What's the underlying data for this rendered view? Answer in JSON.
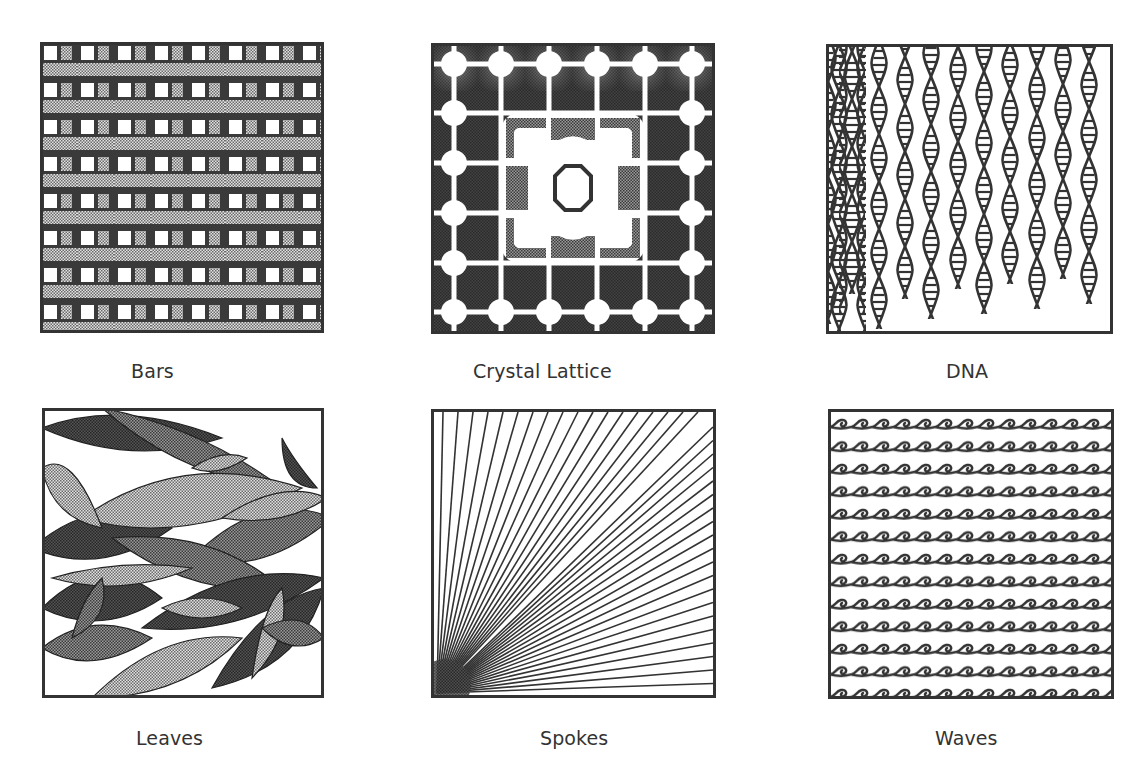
{
  "figure": {
    "patterns": [
      {
        "id": "bars",
        "label": "Bars",
        "icon": "bars-pattern-icon"
      },
      {
        "id": "crystal-lattice",
        "label": "Crystal Lattice",
        "icon": "crystal-lattice-pattern-icon"
      },
      {
        "id": "dna",
        "label": "DNA",
        "icon": "dna-pattern-icon"
      },
      {
        "id": "leaves",
        "label": "Leaves",
        "icon": "leaves-pattern-icon"
      },
      {
        "id": "spokes",
        "label": "Spokes",
        "icon": "spokes-pattern-icon"
      },
      {
        "id": "waves",
        "label": "Waves",
        "icon": "waves-pattern-icon"
      }
    ]
  },
  "colors": {
    "ink": "#333333",
    "dark": "#3a3a3a",
    "mid": "#7a7a7a",
    "light": "#b4b4b4",
    "paper": "#ffffff"
  }
}
